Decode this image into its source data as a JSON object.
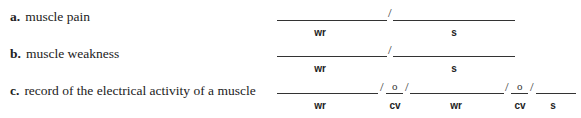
{
  "items": [
    {
      "letter": "a.",
      "text": "muscle pain",
      "labels": [
        "wr",
        "s"
      ],
      "combining": []
    },
    {
      "letter": "b.",
      "text": "muscle weakness",
      "labels": [
        "wr",
        "s"
      ],
      "combining": []
    },
    {
      "letter": "c.",
      "text": "record of the electrical activity of a muscle",
      "labels": [
        "wr",
        "cv",
        "wr",
        "cv",
        "s"
      ],
      "combining": [
        "o",
        "o"
      ]
    }
  ],
  "separator": "/"
}
